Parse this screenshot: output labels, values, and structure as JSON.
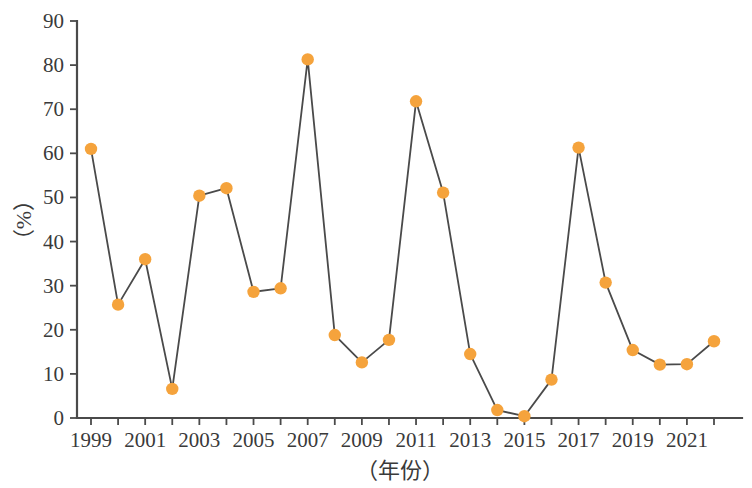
{
  "chart_data": {
    "type": "line",
    "title": "",
    "subtitle": "",
    "xlabel": "（年份）",
    "ylabel": "（%）",
    "x": [
      1999,
      2000,
      2001,
      2002,
      2003,
      2004,
      2005,
      2006,
      2007,
      2008,
      2009,
      2010,
      2011,
      2012,
      2013,
      2014,
      2015,
      2016,
      2017,
      2018,
      2019,
      2020,
      2021,
      2022
    ],
    "values": [
      61.0,
      25.7,
      36.0,
      6.6,
      50.4,
      52.1,
      28.6,
      29.4,
      81.3,
      18.8,
      12.6,
      17.7,
      71.8,
      51.1,
      14.5,
      1.8,
      0.4,
      8.7,
      61.3,
      30.7,
      15.4,
      12.1,
      12.2,
      17.4
    ],
    "series": [
      {
        "name": "",
        "values": [
          61.0,
          25.7,
          36.0,
          6.6,
          50.4,
          52.1,
          28.6,
          29.4,
          81.3,
          18.8,
          12.6,
          17.7,
          71.8,
          51.1,
          14.5,
          1.8,
          0.4,
          8.7,
          61.3,
          30.7,
          15.4,
          12.1,
          12.2,
          17.4
        ],
        "marker": "circle",
        "marker_color": "#F5A33C",
        "line_color": "#4A4A4A"
      }
    ],
    "xlim": [
      1998.4,
      2022.6
    ],
    "ylim": [
      0,
      90
    ],
    "yticks": [
      0,
      10,
      20,
      30,
      40,
      50,
      60,
      70,
      80,
      90
    ],
    "ytick_labels": [
      "0",
      "10",
      "20",
      "30",
      "40",
      "50",
      "60",
      "70",
      "80",
      "90"
    ],
    "xticks": [
      1999,
      2000,
      2001,
      2002,
      2003,
      2004,
      2005,
      2006,
      2007,
      2008,
      2009,
      2010,
      2011,
      2012,
      2013,
      2014,
      2015,
      2016,
      2017,
      2018,
      2019,
      2020,
      2021,
      2022
    ],
    "xtick_labels_visible": [
      "1999",
      "2001",
      "2003",
      "2005",
      "2007",
      "2009",
      "2011",
      "2013",
      "2015",
      "2017",
      "2019",
      "2021"
    ],
    "xtick_labeled_values": [
      1999,
      2001,
      2003,
      2005,
      2007,
      2009,
      2011,
      2013,
      2015,
      2017,
      2019,
      2021
    ],
    "grid": false,
    "legend": null,
    "legend_position": "none",
    "annotations": [],
    "axis_color": "#4A4A4A"
  }
}
